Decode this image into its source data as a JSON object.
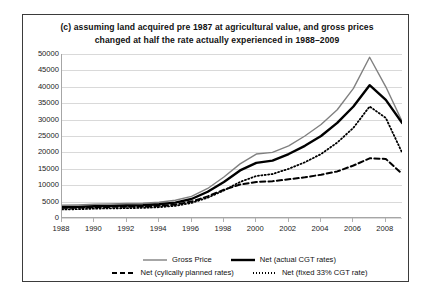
{
  "chart_data": {
    "type": "line",
    "title": "(c) assuming land acquired pre 1987 at agricultural value, and gross prices changed at half the rate actually experienced in 1988–2009",
    "xlabel": "",
    "ylabel": "",
    "ylim": [
      0,
      50000
    ],
    "xlim": [
      1988,
      2009
    ],
    "grid": true,
    "legend_position": "bottom",
    "yticks": [
      0,
      5000,
      10000,
      15000,
      20000,
      25000,
      30000,
      35000,
      40000,
      45000,
      50000
    ],
    "ytick_labels": [
      "0",
      "5000",
      "10000",
      "15000",
      "20000",
      "25000",
      "30000",
      "35000",
      "40000",
      "45000",
      "50000"
    ],
    "xticks": [
      1988,
      1990,
      1992,
      1994,
      1996,
      1998,
      2000,
      2002,
      2004,
      2006,
      2008
    ],
    "xtick_labels": [
      "1988",
      "1990",
      "1992",
      "1994",
      "1996",
      "1998",
      "2000",
      "2002",
      "2004",
      "2006",
      "2008"
    ],
    "x": [
      1988,
      1989,
      1990,
      1991,
      1992,
      1993,
      1994,
      1995,
      1996,
      1997,
      1998,
      1999,
      2000,
      2001,
      2002,
      2003,
      2004,
      2005,
      2006,
      2007,
      2008,
      2009
    ],
    "series": [
      {
        "name": "Gross Price",
        "style": "solid",
        "color": "#808080",
        "width": 1.4,
        "values": [
          3900,
          4000,
          4200,
          4300,
          4400,
          4500,
          4800,
          5400,
          6600,
          9000,
          12500,
          16500,
          19500,
          20000,
          22000,
          25000,
          28500,
          33000,
          39500,
          49000,
          40000,
          29500
        ]
      },
      {
        "name": "Net (actual CGT rates)",
        "style": "solid",
        "color": "#000000",
        "width": 2.4,
        "values": [
          3300,
          3400,
          3600,
          3700,
          3800,
          3900,
          4200,
          4700,
          5800,
          8000,
          11000,
          14500,
          16800,
          17500,
          19500,
          22000,
          25000,
          29000,
          34000,
          40500,
          36000,
          29000
        ]
      },
      {
        "name": "Net (cylically planned rates)",
        "style": "dashed",
        "color": "#000000",
        "width": 2.0,
        "values": [
          3100,
          3150,
          3300,
          3400,
          3450,
          3500,
          3700,
          4100,
          5000,
          6600,
          8600,
          10200,
          11000,
          11200,
          11800,
          12400,
          13200,
          14200,
          16000,
          18200,
          18000,
          13500
        ]
      },
      {
        "name": "Net (fixed 33% CGT rate)",
        "style": "dotted",
        "color": "#000000",
        "width": 1.8,
        "values": [
          2600,
          2700,
          2850,
          2950,
          3000,
          3100,
          3300,
          3700,
          4600,
          6200,
          8400,
          11000,
          12800,
          13400,
          15000,
          17000,
          19500,
          23000,
          27500,
          34000,
          30500,
          20000
        ]
      }
    ]
  },
  "legend": {
    "items": [
      {
        "label": "Gross Price"
      },
      {
        "label": "Net (actual CGT rates)"
      },
      {
        "label": "Net (cylically planned rates)"
      },
      {
        "label": "Net (fixed 33% CGT rate)"
      }
    ]
  }
}
